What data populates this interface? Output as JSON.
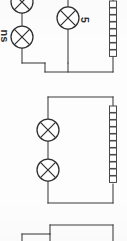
{
  "document": {
    "kind": "scanned-circuit-diagram-fragment",
    "title": "Electrical circuit diagram fragment",
    "background_color": "#fdfdfd",
    "ink_color": "#3a3a3a",
    "width": 127,
    "height": 241
  },
  "circuits": [
    {
      "id": "circuit-top",
      "name": "top-circuit",
      "note": "partially cropped at top and left edges",
      "lamps": [
        {
          "id": "lamp-top-left-upper",
          "label": "",
          "cx": 22,
          "cy": 2,
          "r": 11,
          "cropped": true
        },
        {
          "id": "lamp-top-left-lower",
          "label": "",
          "cx": 22,
          "cy": 37,
          "r": 11,
          "cropped": false
        },
        {
          "id": "lamp-top-right",
          "label": "5",
          "cx": 68,
          "cy": 18,
          "r": 11,
          "cropped": false
        }
      ],
      "coils": [
        {
          "id": "coil-top-right",
          "x": 111,
          "y": 0,
          "links": 8,
          "cropped": true
        }
      ]
    },
    {
      "id": "circuit-middle",
      "name": "middle-circuit",
      "note": "complete rectangular loop",
      "lamps": [
        {
          "id": "lamp-mid-upper",
          "label": "",
          "cx": 48,
          "cy": 130,
          "r": 11
        },
        {
          "id": "lamp-mid-lower",
          "label": "",
          "cx": 48,
          "cy": 170,
          "r": 11
        }
      ],
      "coils": [
        {
          "id": "coil-mid-right",
          "x": 111,
          "y": 105,
          "links": 11,
          "cropped": false
        }
      ]
    },
    {
      "id": "circuit-bottom",
      "name": "bottom-circuit",
      "note": "cropped at bottom edge, only upper wiring visible",
      "lamps": [],
      "coils": []
    }
  ],
  "labels": [
    {
      "id": "label-lamp-5",
      "text": "5",
      "rotation": 90,
      "x": 84,
      "y": 20,
      "belongs_to": "lamp-top-right"
    },
    {
      "id": "label-left-cropped",
      "text": "ns",
      "rotation": 90,
      "x": 4,
      "y": 36,
      "belongs_to": "lamp-top-left-lower",
      "cropped": true
    }
  ],
  "symbols": {
    "lamp": "lamp-icon",
    "coil": "coil-icon",
    "wire": "wire-icon"
  }
}
